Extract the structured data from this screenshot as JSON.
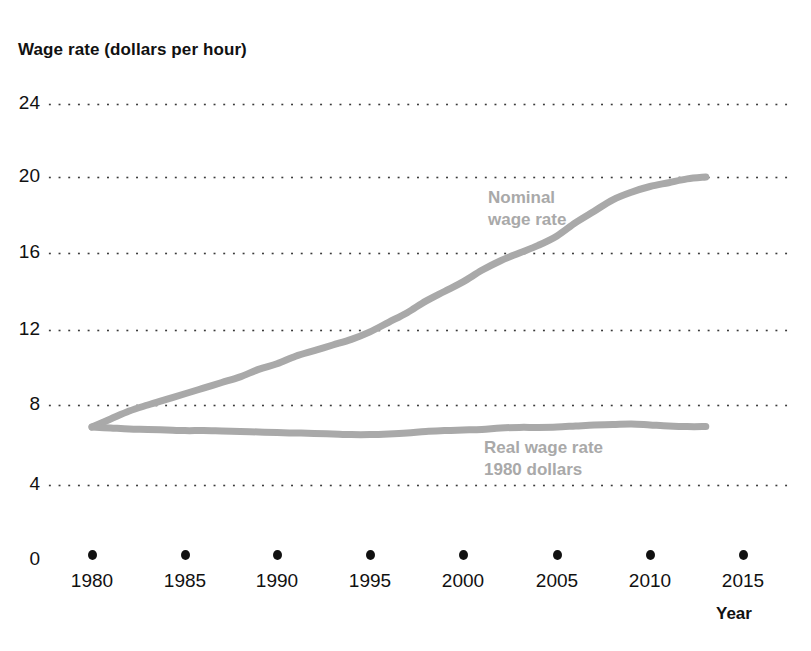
{
  "chart_data": {
    "type": "line",
    "title": "Wage rate (dollars per hour)",
    "xlabel": "Year",
    "ylabel": "Wage rate (dollars per hour)",
    "xlim": [
      1980,
      2015
    ],
    "ylim": [
      0,
      24
    ],
    "grid": true,
    "grid_style": "dotted-horizontal",
    "legend_position": "inline-annotation",
    "x_ticks": [
      1980,
      1985,
      1990,
      1995,
      2000,
      2005,
      2010,
      2015
    ],
    "x_tick_labels": [
      "1980",
      "1985",
      "1990",
      "1995",
      "2000",
      "2005",
      "2010",
      "2015"
    ],
    "y_ticks": [
      0,
      4,
      8,
      12,
      16,
      20,
      24
    ],
    "y_tick_labels": [
      "0",
      "4",
      "8",
      "12",
      "16",
      "20",
      "24"
    ],
    "x": [
      1980,
      1981,
      1982,
      1983,
      1984,
      1985,
      1986,
      1987,
      1988,
      1989,
      1990,
      1991,
      1992,
      1993,
      1994,
      1995,
      1996,
      1997,
      1998,
      1999,
      2000,
      2001,
      2002,
      2003,
      2004,
      2005,
      2006,
      2007,
      2008,
      2009,
      2010,
      2011,
      2012,
      2013
    ],
    "series": [
      {
        "name": "Nominal wage rate",
        "color": "#a9a9a9",
        "label_line1": "Nominal",
        "label_line2": "wage rate",
        "values": [
          6.9,
          7.3,
          7.7,
          8.0,
          8.3,
          8.6,
          8.9,
          9.2,
          9.5,
          9.9,
          10.2,
          10.6,
          10.9,
          11.2,
          11.5,
          11.9,
          12.4,
          12.9,
          13.5,
          14.0,
          14.5,
          15.1,
          15.6,
          16.0,
          16.4,
          16.9,
          17.6,
          18.2,
          18.8,
          19.2,
          19.5,
          19.7,
          19.9,
          20.0
        ]
      },
      {
        "name": "Real wage rate (1980 dollars)",
        "color": "#a9a9a9",
        "label_line1": "Real wage rate",
        "label_line2": "1980 dollars",
        "values": [
          6.9,
          6.85,
          6.8,
          6.78,
          6.75,
          6.72,
          6.72,
          6.7,
          6.68,
          6.65,
          6.62,
          6.6,
          6.58,
          6.55,
          6.52,
          6.52,
          6.55,
          6.6,
          6.68,
          6.72,
          6.75,
          6.78,
          6.85,
          6.88,
          6.88,
          6.9,
          6.95,
          7.0,
          7.02,
          7.05,
          7.0,
          6.95,
          6.92,
          6.92
        ]
      }
    ]
  },
  "axis": {
    "y_title": "Wage rate (dollars per hour)",
    "x_title": "Year"
  }
}
